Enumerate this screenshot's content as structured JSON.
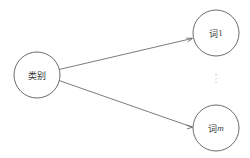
{
  "diagram": {
    "background_color": "#ffffff",
    "stroke_color": "#5a5a5a",
    "text_color": "#3a3a3a",
    "ellipsis_color": "#c9c9c9",
    "nodes": [
      {
        "id": "category",
        "label": "类别",
        "cx": 37,
        "cy": 75,
        "r": 23
      },
      {
        "id": "word-1",
        "label_stem": "词",
        "label_index": "1",
        "label": "词1",
        "cx": 216,
        "cy": 33,
        "r": 23
      },
      {
        "id": "word-m",
        "label_stem": "词",
        "label_index": "m",
        "label": "词m",
        "cx": 216,
        "cy": 128,
        "r": 23
      }
    ],
    "edges": [
      {
        "id": "edge-category-to-word-1",
        "from": "category",
        "to": "word-1",
        "label": ""
      },
      {
        "id": "edge-category-to-word-m",
        "from": "category",
        "to": "word-m",
        "label": ""
      }
    ],
    "ellipsis": {
      "glyph": "⋮",
      "x": 216,
      "y": 79
    }
  }
}
